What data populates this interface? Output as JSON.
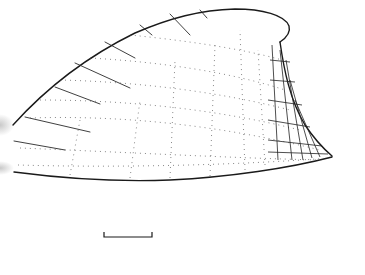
{
  "figure": {
    "style": "stippled line drawing",
    "colors": {
      "ink": "#1a1a1a",
      "background": "#ffffff"
    },
    "scale_bar": {
      "x1": 104,
      "x2": 152,
      "y": 236,
      "label": ""
    }
  }
}
